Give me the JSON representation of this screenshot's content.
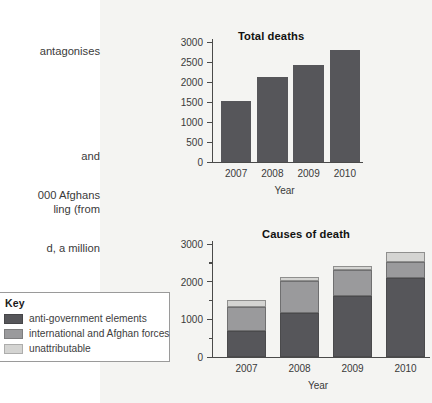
{
  "page": {
    "background_color": "#ffffff",
    "panel_color": "#f4f4f2"
  },
  "body_text": {
    "top_lines": [
      "antagonises",
      "",
      "and",
      "ling (from"
    ],
    "bottom_lines": [
      "000 Afghans",
      "d, a million",
      "ed to flee the",
      ", deaths have"
    ]
  },
  "legend": {
    "title": "Key",
    "items": [
      {
        "label": "anti-government elements",
        "color": "#56565a"
      },
      {
        "label": "international and Afghan forces",
        "color": "#9a9a9c"
      },
      {
        "label": "unattributable",
        "color": "#d4d4d2"
      }
    ]
  },
  "chart_data": [
    {
      "id": "total-deaths",
      "type": "bar",
      "title": "Total deaths",
      "xlabel": "Year",
      "ylabel": "",
      "categories": [
        "2007",
        "2008",
        "2009",
        "2010"
      ],
      "values": [
        1520,
        2120,
        2420,
        2790
      ],
      "ylim": [
        0,
        3000
      ],
      "ytick_labels": [
        "0",
        "500",
        "1000",
        "1500",
        "2000",
        "2500",
        "3000"
      ],
      "ytick_values": [
        0,
        500,
        1000,
        1500,
        2000,
        2500,
        3000
      ],
      "bar_color": "#56565a",
      "grid": false,
      "legend_position": "none"
    },
    {
      "id": "causes-of-death",
      "type": "bar",
      "subtype": "stacked",
      "title": "Causes of death",
      "xlabel": "Year",
      "ylabel": "",
      "categories": [
        "2007",
        "2008",
        "2009",
        "2010"
      ],
      "series": [
        {
          "name": "anti-government elements",
          "color": "#56565a",
          "values": [
            700,
            1160,
            1630,
            2100
          ]
        },
        {
          "name": "international and Afghan forces",
          "color": "#9a9a9c",
          "values": [
            630,
            870,
            690,
            420
          ]
        },
        {
          "name": "unattributable",
          "color": "#d4d4d2",
          "values": [
            190,
            100,
            100,
            270
          ]
        }
      ],
      "totals": [
        1520,
        2130,
        2420,
        2790
      ],
      "ylim": [
        0,
        3000
      ],
      "ytick_labels": [
        "0",
        "1000",
        "2000",
        "3000"
      ],
      "ytick_values": [
        0,
        1000,
        2000,
        3000
      ],
      "minor_ytick_values": [
        500,
        1500,
        2500
      ],
      "grid": false,
      "legend_position": "external-left"
    }
  ]
}
